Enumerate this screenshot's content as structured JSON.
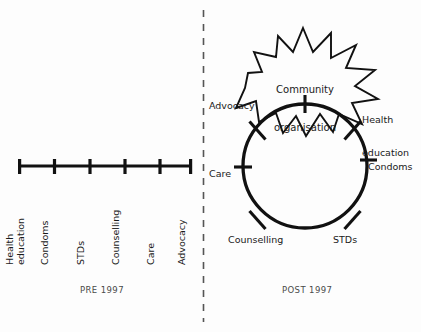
{
  "figure": {
    "background_color": "#fdfdfd",
    "ink_color": "#111111",
    "text_color": "#1a1a1a",
    "caption_color": "#4a4a4a"
  },
  "divider": {
    "name": "vertical-dashed-divider",
    "style": "dashed",
    "x": 203,
    "y_top": 10,
    "y_bottom": 322
  },
  "left_panel": {
    "caption": "PRE 1997",
    "diagram_type": "linear-scale",
    "axis": {
      "x_start": 19,
      "x_end": 192,
      "y": 166
    },
    "ticks": [
      {
        "label": "Health\neducation",
        "label_line1": "Health",
        "label_line2": "education",
        "x": 19
      },
      {
        "label": "Condoms",
        "label_line1": "Condoms",
        "label_line2": "",
        "x": 54
      },
      {
        "label": "STDs",
        "label_line1": "STDs",
        "label_line2": "",
        "x": 90
      },
      {
        "label": "Counselling",
        "label_line1": "Counselling",
        "label_line2": "",
        "x": 125
      },
      {
        "label": "Care",
        "label_line1": "Care",
        "label_line2": "",
        "x": 160
      },
      {
        "label": "Advocacy",
        "label_line1": "Advocacy",
        "label_line2": "",
        "x": 192
      }
    ]
  },
  "right_panel": {
    "caption": "POST 1997",
    "diagram_type": "circle-cycle",
    "circle": {
      "cx": 305,
      "cy": 166,
      "r": 62
    },
    "burst": {
      "label": "Community\norganisation",
      "label_line1": "Community",
      "label_line2": "organisation"
    },
    "nodes": [
      {
        "label": "Advocacy",
        "angle_deg": 215,
        "anchor": "end"
      },
      {
        "label": "Health\neducation",
        "label_line1": "Health",
        "label_line2": "education",
        "angle_deg": 325,
        "anchor": "start"
      },
      {
        "label": "Condoms",
        "angle_deg": 25,
        "anchor": "start"
      },
      {
        "label": "STDs",
        "angle_deg": 65,
        "anchor": "start"
      },
      {
        "label": "Counselling",
        "angle_deg": 115,
        "anchor": "end"
      },
      {
        "label": "Care",
        "angle_deg": 180,
        "anchor": "end"
      }
    ]
  }
}
